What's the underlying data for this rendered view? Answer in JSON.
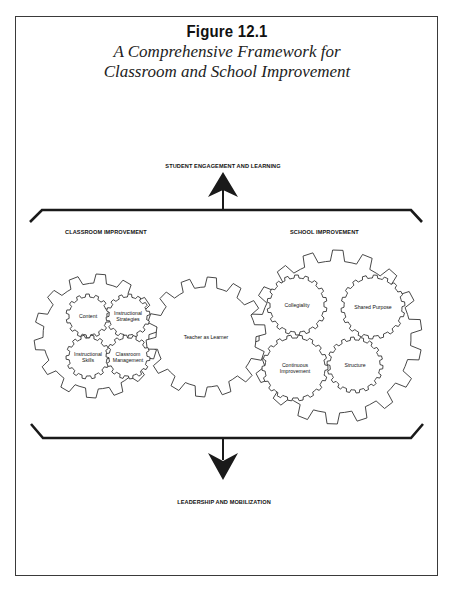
{
  "figure": {
    "number": "Figure 12.1",
    "title_line1": "A Comprehensive Framework for",
    "title_line2": "Classroom and School Improvement"
  },
  "labels": {
    "top_outcome": "STUDENT ENGAGEMENT AND LEARNING",
    "bottom_driver": "LEADERSHIP AND MOBILIZATION",
    "left_section": "CLASSROOM IMPROVEMENT",
    "right_section": "SCHOOL IMPROVEMENT"
  },
  "gears": {
    "classroom": {
      "outer": {
        "cx": 96,
        "cy": 336,
        "r_out": 62,
        "r_in": 53,
        "teeth": 14,
        "label": ""
      },
      "inner": [
        {
          "cx": 88,
          "cy": 316,
          "r_out": 22,
          "r_in": 19,
          "teeth": 14,
          "lines": [
            "Content"
          ]
        },
        {
          "cx": 128,
          "cy": 316,
          "r_out": 22,
          "r_in": 19,
          "teeth": 14,
          "lines": [
            "Instructional",
            "Strategies"
          ]
        },
        {
          "cx": 88,
          "cy": 357,
          "r_out": 22,
          "r_in": 19,
          "teeth": 14,
          "lines": [
            "Instructional",
            "Skills"
          ]
        },
        {
          "cx": 128,
          "cy": 357,
          "r_out": 22,
          "r_in": 19,
          "teeth": 14,
          "lines": [
            "Classroom",
            "Management"
          ]
        }
      ]
    },
    "center": {
      "cx": 206,
      "cy": 337,
      "r_out": 60,
      "r_in": 50,
      "teeth": 14,
      "lines": [
        "Teacher as Learner"
      ]
    },
    "school": {
      "outer": {
        "cx": 335,
        "cy": 337,
        "r_out": 87,
        "r_in": 76,
        "teeth": 18,
        "label": ""
      },
      "inner": [
        {
          "cx": 297,
          "cy": 305,
          "r_out": 30,
          "r_in": 27,
          "teeth": 18,
          "lines": [
            "Collegiality"
          ]
        },
        {
          "cx": 373,
          "cy": 307,
          "r_out": 32,
          "r_in": 29,
          "teeth": 18,
          "lines": [
            "Shared Purpose"
          ]
        },
        {
          "cx": 295,
          "cy": 368,
          "r_out": 33,
          "r_in": 30,
          "teeth": 18,
          "lines": [
            "Continuous",
            "Improvement"
          ]
        },
        {
          "cx": 355,
          "cy": 365,
          "r_out": 28,
          "r_in": 25,
          "teeth": 18,
          "lines": [
            "Structure"
          ]
        }
      ]
    }
  },
  "colors": {
    "line": "#1a1a1a",
    "gear_stroke": "#333333",
    "background": "#ffffff"
  }
}
